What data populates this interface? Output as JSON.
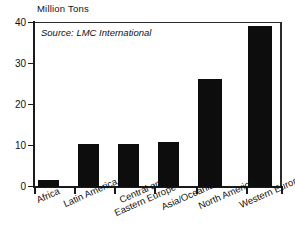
{
  "chart_data": {
    "type": "bar",
    "title": "",
    "subtitle": "",
    "ylabel": "Million Tons",
    "xlabel": "",
    "ylim": [
      0,
      40
    ],
    "yticks": [
      0,
      10,
      20,
      30,
      40
    ],
    "ytick_labels": [
      "0",
      "10",
      "20",
      "30",
      "40"
    ],
    "grid": false,
    "legend": null,
    "annotations": [
      "Source: LMC International"
    ],
    "source_note": "Source: LMC International",
    "categories": [
      "Africa",
      "Latin America",
      "Central and\nEastern Europe",
      "Asia/Oceania",
      "North America",
      "Western Europe"
    ],
    "values": [
      1.8,
      10.5,
      10.4,
      11.0,
      26.2,
      39.0
    ],
    "bar_color": "#0d0d0d"
  },
  "axis": {
    "ylabel": "Million Tons",
    "ytick_labels": [
      "40",
      "30",
      "20",
      "10",
      "0"
    ]
  },
  "note": {
    "source": "Source: LMC International"
  },
  "categories": {
    "c0": "Africa",
    "c1": "Latin America",
    "c2a": "Central and",
    "c2b": "Eastern Europe",
    "c3": "Asia/Oceania",
    "c4": "North America",
    "c5": "Western Europe"
  }
}
